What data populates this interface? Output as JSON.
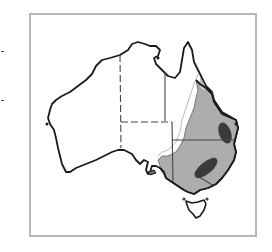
{
  "map": {
    "subject": "Australia distribution map",
    "regions": [
      "Western Australia",
      "Northern Territory",
      "South Australia",
      "Queensland",
      "New South Wales",
      "Victoria",
      "Tasmania"
    ],
    "shading": {
      "light_range_color": "#a8a8a8",
      "core_range_color": "#3a3a3a",
      "outline_color": "#1a1a1a",
      "boundary_color": "#444444"
    },
    "notes": "Shaded eastern distribution covering eastern QLD, NSW, VIC and south-east SA with two dark core areas"
  }
}
